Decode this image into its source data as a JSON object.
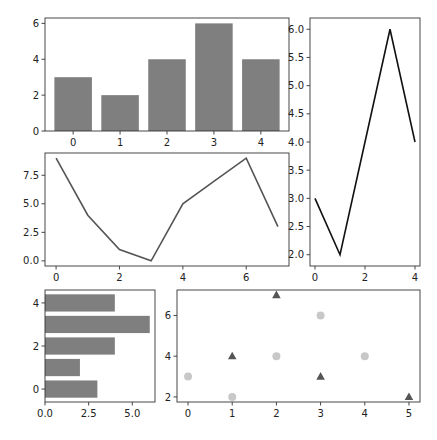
{
  "chart_data": [
    {
      "id": "bar",
      "type": "bar",
      "title": "",
      "xlabel": "",
      "ylabel": "",
      "categories": [
        "0",
        "1",
        "2",
        "3",
        "4"
      ],
      "x": [
        0,
        1,
        2,
        3,
        4
      ],
      "values": [
        3,
        2,
        4,
        6,
        4
      ],
      "color": "#7f7f7f",
      "xticks": [
        0,
        1,
        2,
        3,
        4
      ],
      "yticks": [
        0,
        2,
        4,
        6
      ],
      "xlim": [
        -0.6,
        4.6
      ],
      "ylim": [
        0,
        6.3
      ],
      "frame": {
        "x0": 45,
        "y0": 18,
        "x1": 289,
        "y1": 131
      },
      "grid": false
    },
    {
      "id": "line-right",
      "type": "line",
      "title": "",
      "xlabel": "",
      "ylabel": "",
      "x": [
        0,
        1,
        2,
        3,
        4
      ],
      "values": [
        3,
        2,
        4,
        6,
        4
      ],
      "color": "#111111",
      "xticks": [
        0,
        2,
        4
      ],
      "yticks": [
        2.0,
        2.5,
        3.0,
        3.5,
        4.0,
        4.5,
        5.0,
        5.5,
        6.0
      ],
      "ytick_labels": [
        "2.0",
        "2.5",
        "3.0",
        "3.5",
        "4.0",
        "4.5",
        "5.0",
        "5.5",
        "6.0"
      ],
      "xlim": [
        -0.2,
        4.2
      ],
      "ylim": [
        1.8,
        6.2
      ],
      "frame": {
        "x0": 310,
        "y0": 18,
        "x1": 420,
        "y1": 266
      },
      "grid": false
    },
    {
      "id": "line-middle",
      "type": "line",
      "title": "",
      "xlabel": "",
      "ylabel": "",
      "x": [
        0,
        1,
        2,
        3,
        4,
        5,
        6,
        7
      ],
      "values": [
        9,
        4,
        1,
        0,
        5,
        7,
        9,
        3
      ],
      "color": "#555555",
      "xticks": [
        0,
        2,
        4,
        6
      ],
      "yticks": [
        0.0,
        2.5,
        5.0,
        7.5
      ],
      "ytick_labels": [
        "0.0",
        "2.5",
        "5.0",
        "7.5"
      ],
      "xlim": [
        -0.35,
        7.35
      ],
      "ylim": [
        -0.45,
        9.45
      ],
      "frame": {
        "x0": 45,
        "y0": 153,
        "x1": 289,
        "y1": 266
      },
      "grid": false
    },
    {
      "id": "hbar",
      "type": "bar",
      "orientation": "horizontal",
      "title": "",
      "xlabel": "",
      "ylabel": "",
      "categories": [
        "0",
        "1",
        "2",
        "3",
        "4"
      ],
      "y": [
        0,
        1,
        2,
        3,
        4
      ],
      "values": [
        3,
        2,
        4,
        6,
        4
      ],
      "color": "#7f7f7f",
      "xticks": [
        0.0,
        2.5,
        5.0
      ],
      "xtick_labels": [
        "0.0",
        "2.5",
        "5.0"
      ],
      "yticks": [
        0,
        2,
        4
      ],
      "xlim": [
        0,
        6.3
      ],
      "ylim": [
        -0.6,
        4.6
      ],
      "frame": {
        "x0": 45,
        "y0": 290,
        "x1": 155,
        "y1": 402
      },
      "grid": false
    },
    {
      "id": "scatter",
      "type": "scatter",
      "title": "",
      "xlabel": "",
      "ylabel": "",
      "series": [
        {
          "name": "circles",
          "marker": "circle",
          "color": "#c8c8c8",
          "x": [
            0,
            1,
            2,
            3,
            4
          ],
          "y": [
            3,
            2,
            4,
            6,
            4
          ]
        },
        {
          "name": "triangles",
          "marker": "triangle",
          "color": "#555555",
          "x": [
            1,
            2,
            3,
            5
          ],
          "y": [
            4,
            7,
            3,
            2
          ]
        }
      ],
      "xticks": [
        0,
        1,
        2,
        3,
        4,
        5
      ],
      "yticks": [
        2,
        4,
        6
      ],
      "xlim": [
        -0.25,
        5.25
      ],
      "ylim": [
        1.75,
        7.25
      ],
      "frame": {
        "x0": 177,
        "y0": 290,
        "x1": 420,
        "y1": 402
      },
      "grid": false
    }
  ]
}
